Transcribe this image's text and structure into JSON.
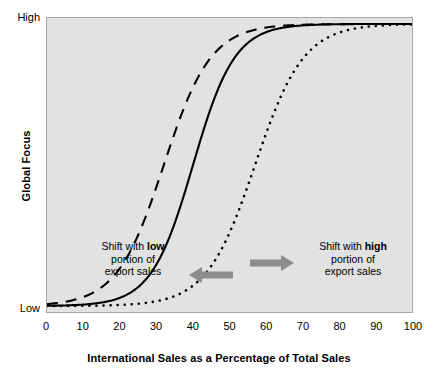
{
  "chart_data": {
    "type": "line",
    "title": "",
    "xlabel": "International Sales as a Percentage of Total Sales",
    "ylabel": "Global Focus",
    "xlim": [
      0,
      100
    ],
    "ylim": [
      0,
      1
    ],
    "grid": false,
    "legend_position": "none",
    "plot_background": "#e2e2e2",
    "x_ticks": [
      {
        "value": 0,
        "label": "0"
      },
      {
        "value": 10,
        "label": "10"
      },
      {
        "value": 20,
        "label": "20"
      },
      {
        "value": 30,
        "label": "30"
      },
      {
        "value": 40,
        "label": "40"
      },
      {
        "value": 50,
        "label": "50"
      },
      {
        "value": 60,
        "label": "60"
      },
      {
        "value": 70,
        "label": "70"
      },
      {
        "value": 80,
        "label": "80"
      },
      {
        "value": 90,
        "label": "90"
      },
      {
        "value": 100,
        "label": "100"
      }
    ],
    "y_ticks": [
      {
        "value": 1,
        "label": "High"
      },
      {
        "value": 0,
        "label": "Low"
      }
    ],
    "series": [
      {
        "name": "Shift with low portion of export sales",
        "style": "dashed",
        "color": "#000000",
        "midpoint": 32,
        "steepness": 0.155,
        "x": [
          0,
          5,
          10,
          15,
          20,
          25,
          30,
          35,
          40,
          45,
          50,
          55,
          60,
          65,
          70,
          75,
          80,
          85,
          90,
          95,
          100
        ],
        "values": [
          0.008,
          0.017,
          0.037,
          0.078,
          0.158,
          0.296,
          0.489,
          0.683,
          0.827,
          0.913,
          0.959,
          0.981,
          0.991,
          0.996,
          0.998,
          0.999,
          1.0,
          1.0,
          1.0,
          1.0,
          1.0
        ]
      },
      {
        "name": "Baseline global focus",
        "style": "solid",
        "color": "#000000",
        "midpoint": 40,
        "steepness": 0.175,
        "x": [
          0,
          5,
          10,
          15,
          20,
          25,
          30,
          35,
          40,
          45,
          50,
          55,
          60,
          65,
          70,
          75,
          80,
          85,
          90,
          95,
          100
        ],
        "values": [
          0.001,
          0.003,
          0.005,
          0.013,
          0.03,
          0.07,
          0.155,
          0.312,
          0.528,
          0.731,
          0.869,
          0.941,
          0.975,
          0.99,
          0.996,
          0.998,
          0.999,
          1.0,
          1.0,
          1.0,
          1.0
        ]
      },
      {
        "name": "Shift with high portion of export sales",
        "style": "dotted",
        "color": "#000000",
        "midpoint": 57,
        "steepness": 0.15,
        "x": [
          0,
          5,
          10,
          15,
          20,
          25,
          30,
          35,
          40,
          45,
          50,
          55,
          60,
          65,
          70,
          75,
          80,
          85,
          90,
          95,
          100
        ],
        "values": [
          0.0002,
          0.0005,
          0.001,
          0.002,
          0.005,
          0.01,
          0.021,
          0.044,
          0.09,
          0.177,
          0.318,
          0.5,
          0.682,
          0.82,
          0.904,
          0.951,
          0.976,
          0.988,
          0.994,
          0.997,
          0.999
        ]
      }
    ],
    "annotations": [
      {
        "id": "low",
        "line1_prefix": "Shift with ",
        "line1_bold": "low",
        "line2": "portion of",
        "line3": "export sales",
        "arrow": "left",
        "arrow_color": "#8c8c8c"
      },
      {
        "id": "high",
        "line1_prefix": "Shift with ",
        "line1_bold": "high",
        "line2": "portion of",
        "line3": "export sales",
        "arrow": "right",
        "arrow_color": "#8c8c8c"
      }
    ]
  }
}
